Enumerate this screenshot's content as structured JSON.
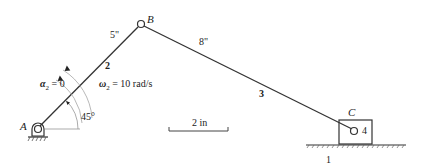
{
  "diagram": {
    "points": {
      "A": {
        "label": "A"
      },
      "B": {
        "label": "B"
      },
      "C": {
        "label": "C"
      }
    },
    "links": {
      "ground": {
        "label": "1"
      },
      "crank": {
        "label": "2",
        "length_label": "5\""
      },
      "coupler": {
        "label": "3",
        "length_label": "8\""
      },
      "slider": {
        "label": "4"
      }
    },
    "angle_label": "45°",
    "omega": {
      "symbol": "ω",
      "subscript": "2",
      "rest": " = 10 rad/s"
    },
    "alpha": {
      "symbol": "α",
      "subscript": "2",
      "rest": " = 0"
    },
    "scale_bar": {
      "label": "2 in"
    },
    "colors": {
      "line": "#333333",
      "background": "#ffffff"
    }
  }
}
